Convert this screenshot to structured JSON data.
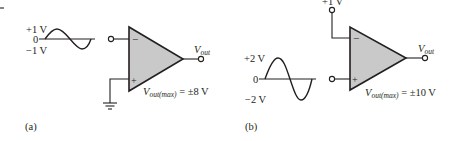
{
  "figure_a": {
    "panel_label": "(a)",
    "input_signal": {
      "type": "sine",
      "peak_pos_label": "+1 V",
      "zero_label": "0",
      "peak_neg_label": "−1 V"
    },
    "inverting_input_symbol": "−",
    "noninverting_input_symbol": "+",
    "noninverting_connection": "ground",
    "output_label_main": "V",
    "output_label_sub": "out",
    "vmax_label_main": "V",
    "vmax_label_sub": "out(max)",
    "vmax_value": " = ±8 V"
  },
  "figure_b": {
    "panel_label": "(b)",
    "input_signal": {
      "type": "sine",
      "peak_pos_label": "+2 V",
      "zero_label": "0",
      "peak_neg_label": "−2 V"
    },
    "reference_label": "+1 V",
    "inverting_input_symbol": "−",
    "noninverting_input_symbol": "+",
    "output_label_main": "V",
    "output_label_sub": "out",
    "vmax_label_main": "V",
    "vmax_label_sub": "out(max)",
    "vmax_value": " = ±10 V"
  },
  "colors": {
    "ink": "#231f20",
    "opamp_fill": "#c9c9c9",
    "background": "#ffffff"
  }
}
